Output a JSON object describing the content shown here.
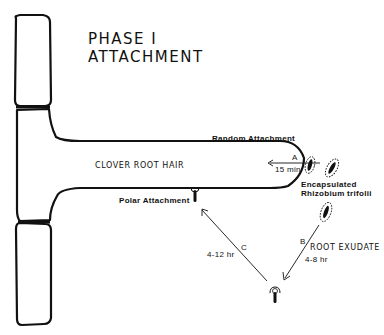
{
  "title": {
    "line1": "PHASE I",
    "line2": "ATTACHMENT"
  },
  "labels": {
    "root_hair": "CLOVER ROOT HAIR",
    "random_attachment": "Random Attachment",
    "polar_attachment": "Polar Attachment",
    "encapsulated_line1": "Encapsulated",
    "encapsulated_line2": "Rhizobium trifolii",
    "root_exudate": "ROOT EXUDATE"
  },
  "steps": [
    {
      "id": "A",
      "letter": "A",
      "time": "15 min"
    },
    {
      "id": "B",
      "letter": "B",
      "time": "4-8 hr"
    },
    {
      "id": "C",
      "letter": "C",
      "time": "4-12 hr"
    }
  ],
  "colors": {
    "ink": "#111111",
    "background": "#ffffff"
  }
}
